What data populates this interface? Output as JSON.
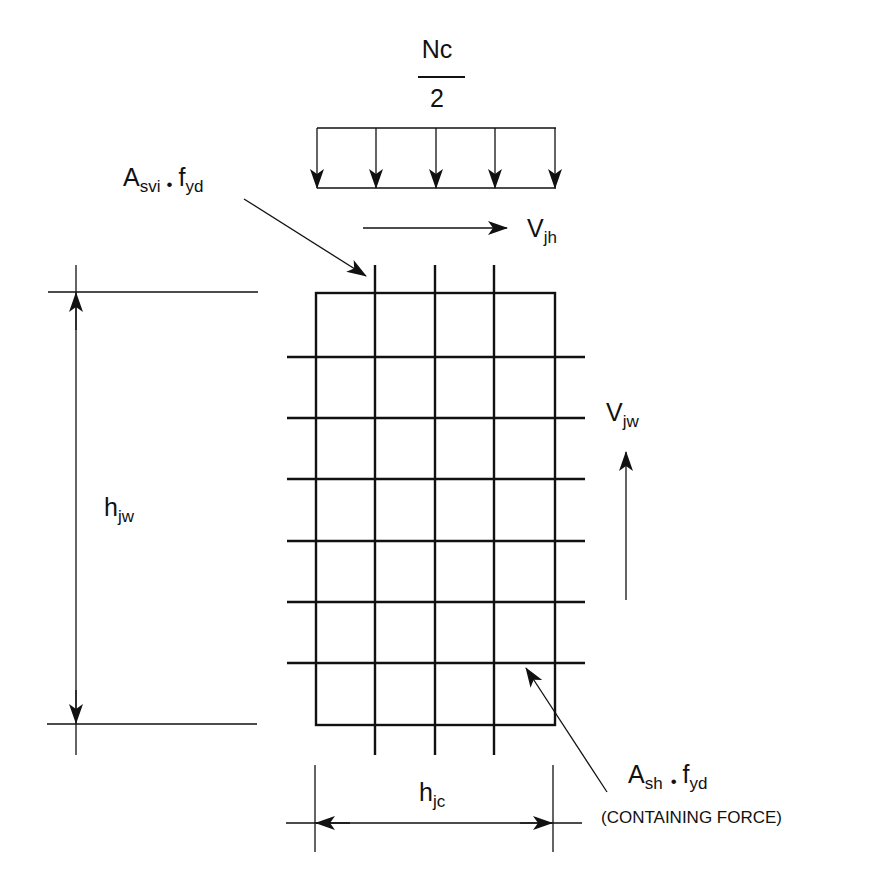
{
  "diagram": {
    "type": "beam-column joint reinforcement / force diagram",
    "axial_load": {
      "numerator": "Nc",
      "denominator": "2",
      "arrow_count": 5
    },
    "vertical_reinforcement_label": {
      "base": "A",
      "sub": "svi",
      "dot": "•",
      "f": "f",
      "fsub": "yd"
    },
    "horizontal_shear_label": {
      "base": "V",
      "sub": "jh"
    },
    "vertical_shear_label": {
      "base": "V",
      "sub": "jw"
    },
    "joint_height_label": {
      "base": "h",
      "sub": "jw"
    },
    "joint_width_label": {
      "base": "h",
      "sub": "jc"
    },
    "horizontal_reinforcement_label": {
      "base": "A",
      "sub": "sh",
      "dot": "•",
      "f": "f",
      "fsub": "yd"
    },
    "containing_force_note": "(CONTAINING FORCE)",
    "grid": {
      "vertical_bars": 3,
      "horizontal_bars": 6
    },
    "colors": {
      "ink": "#111111",
      "background": "#ffffff"
    }
  }
}
